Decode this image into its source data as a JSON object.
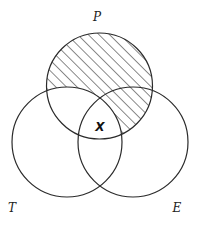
{
  "diagram": {
    "type": "venn",
    "sets": [
      {
        "id": "P",
        "label": "P",
        "cx": 99.5,
        "cy": 86,
        "r": 53
      },
      {
        "id": "T",
        "label": "T",
        "cx": 67,
        "cy": 142,
        "r": 55
      },
      {
        "id": "E",
        "label": "E",
        "cx": 133,
        "cy": 142,
        "r": 55
      }
    ],
    "labels": {
      "P": "P",
      "T": "T",
      "E": "E",
      "region_x": "X"
    },
    "shaded_region": "P minus T",
    "region_x_description": "P ∩ T ∩ E",
    "colors": {
      "stroke": "#2a2a2a",
      "hatch": "#2a2a2a",
      "background": "#ffffff"
    }
  }
}
